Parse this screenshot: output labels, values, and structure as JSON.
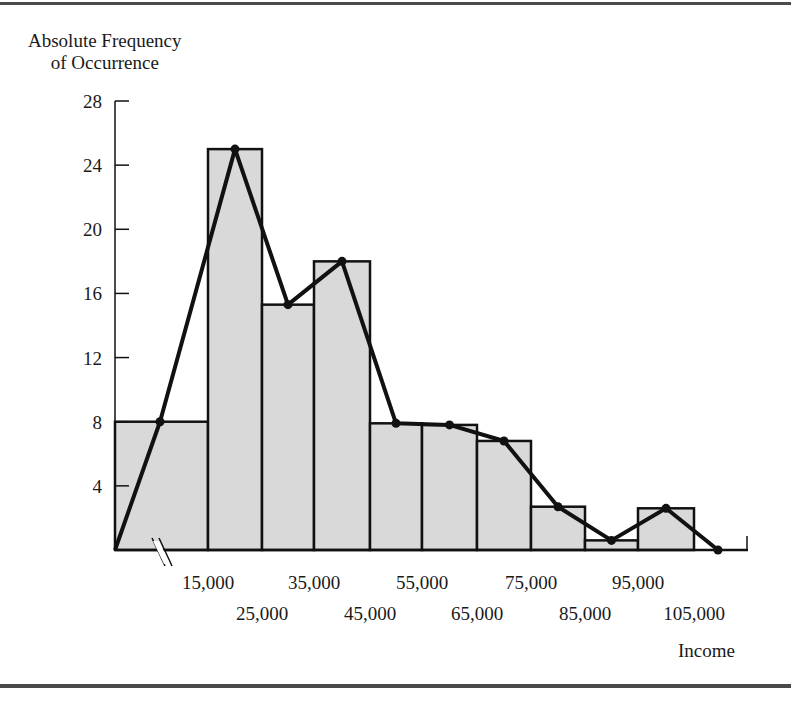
{
  "chart_data": {
    "type": "bar",
    "subtype": "histogram_with_frequency_polygon",
    "title": "",
    "ylabel": "Absolute Frequency of Occurrence",
    "xlabel": "Income",
    "ylim": [
      0,
      28
    ],
    "yticks": [
      4,
      8,
      12,
      16,
      20,
      24,
      28
    ],
    "xtick_labels_upper": [
      "15,000",
      "35,000",
      "55,000",
      "75,000",
      "95,000"
    ],
    "xtick_labels_lower": [
      "25,000",
      "45,000",
      "65,000",
      "85,000",
      "105,000"
    ],
    "bin_edges": [
      0,
      15000,
      25000,
      35000,
      45000,
      55000,
      65000,
      75000,
      85000,
      95000,
      105000
    ],
    "categories": [
      "<15,000",
      "15,000-25,000",
      "25,000-35,000",
      "35,000-45,000",
      "45,000-55,000",
      "55,000-65,000",
      "65,000-75,000",
      "75,000-85,000",
      "85,000-95,000",
      "95,000-105,000"
    ],
    "values": [
      8,
      25,
      15.3,
      18,
      7.9,
      7.8,
      6.8,
      2.7,
      0.6,
      2.6
    ],
    "polygon_points": [
      0,
      8,
      25,
      15.3,
      18,
      7.9,
      7.8,
      6.8,
      2.7,
      0.6,
      2.6,
      0
    ],
    "axis_break": "x-axis break marks between 0 and 15,000",
    "grid": false,
    "legend": "none"
  },
  "labels": {
    "ylabel_line1": "Absolute Frequency",
    "ylabel_line2": "of Occurrence",
    "xlabel": "Income"
  }
}
